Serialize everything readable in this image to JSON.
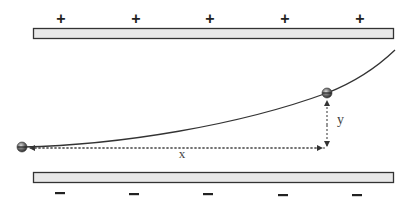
{
  "diagram": {
    "top_plate": {
      "polarity": "positive",
      "signs": [
        "+",
        "+",
        "+",
        "+",
        "+"
      ],
      "sign_x": [
        61,
        136,
        210,
        285,
        360
      ],
      "fill": "#e8e8e8",
      "stroke": "#333333"
    },
    "bottom_plate": {
      "polarity": "negative",
      "signs": [
        "–",
        "–",
        "–",
        "–",
        "–"
      ],
      "sign_x": [
        60,
        134,
        208,
        283,
        357
      ],
      "fill": "#e8e8e8",
      "stroke": "#333333"
    },
    "labels": {
      "x": "x",
      "y": "y"
    },
    "particles": [
      {
        "name": "initial-position",
        "cx": 22,
        "cy": 147
      },
      {
        "name": "current-position",
        "cx": 327,
        "cy": 93
      }
    ],
    "colors": {
      "trajectory": "#333333",
      "dotted": "#444444",
      "particle": "#555555"
    }
  }
}
